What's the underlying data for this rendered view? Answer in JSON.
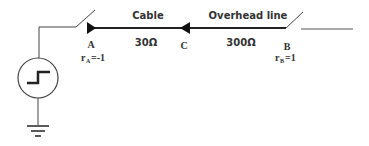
{
  "diagram": {
    "segments": {
      "cable": {
        "label": "Cable",
        "impedance": "30Ω"
      },
      "overhead": {
        "label": "Overhead line",
        "impedance": "300Ω"
      }
    },
    "nodes": {
      "A": {
        "label": "A",
        "coef_prefix": "r",
        "coef_sub": "A",
        "coef_value": "=-1"
      },
      "B": {
        "label": "B",
        "coef_prefix": "r",
        "coef_sub": "B",
        "coef_value": "=1"
      },
      "C": {
        "label": "C"
      }
    },
    "source": {
      "type": "step-voltage-source"
    },
    "colors": {
      "line": "#333333",
      "background": "#ffffff"
    }
  }
}
